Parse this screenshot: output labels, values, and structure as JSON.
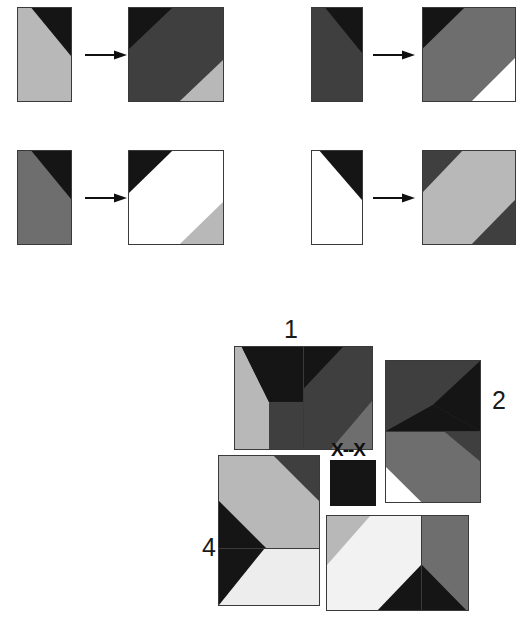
{
  "page": {
    "background_color": "#ffffff",
    "width": 530,
    "height": 625
  },
  "palette": {
    "black": "#151515",
    "dark_gray": "#3f3f3f",
    "mid_gray": "#6e6e6e",
    "light_gray": "#b8b8b8",
    "white": "#ffffff",
    "stroke": "#3a3a3a",
    "text": "#1a1a1a"
  },
  "examples": {
    "section_name": "worked-examples",
    "arrow_glyph": "right-arrow",
    "items": [
      {
        "id": "example-1",
        "source_label": "source-tile-1",
        "target_label": "target-tile-1",
        "source_description": "Tall rectangle: light gray field with black triangle in the upper right corner",
        "target_description": "Square: black upper-left triangle, dark gray diagonal band, light gray lower-right corner"
      },
      {
        "id": "example-2",
        "source_label": "source-tile-2",
        "target_label": "target-tile-2",
        "source_description": "Tall rectangle: dark gray field with black triangle in the upper right corner",
        "target_description": "Square: black upper-left corner, mid gray diagonal band, white lower-right corner"
      },
      {
        "id": "example-3",
        "source_label": "source-tile-3",
        "target_label": "target-tile-3",
        "source_description": "Tall rectangle: mid gray field with black triangle in the upper right corner",
        "target_description": "Square: black upper-left corner, white diagonal band, light gray lower-right corner"
      },
      {
        "id": "example-4",
        "source_label": "source-tile-4",
        "target_label": "target-tile-4",
        "source_description": "Tall rectangle: white field with black triangle in the upper right corner",
        "target_description": "Square: dark gray upper-left corner, light gray diagonal band, dark gray lower-right corner"
      }
    ]
  },
  "options": {
    "section_name": "answer-options",
    "missing_marker": "X--X",
    "items": [
      {
        "number": "1",
        "name": "option-1",
        "description": "Horizontal pair: left tile light gray with black chevron, right tile dark gray with black wedge and gray corner"
      },
      {
        "number": "2",
        "name": "option-2",
        "description": "Vertical pair: top tile dark with black wedge, bottom tile mid gray band with white lower-left corner"
      },
      {
        "number": "4",
        "name": "option-4",
        "description": "Vertical pair: top tile light gray band with black corners, bottom tile black chevron with white field"
      },
      {
        "number": "",
        "name": "option-unlabeled",
        "description": "Horizontal pair: left tile white with light gray corner, right tile mid gray with black wedge"
      }
    ]
  }
}
